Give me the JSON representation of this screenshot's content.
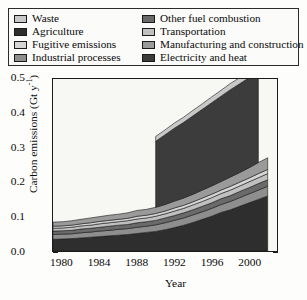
{
  "legend": {
    "items": [
      {
        "label": "Waste",
        "color": "#c8c8c8",
        "col": "left"
      },
      {
        "label": "Agriculture",
        "color": "#2e2e2e",
        "col": "left"
      },
      {
        "label": "Fugitive emissions",
        "color": "#d5d5d5",
        "col": "left"
      },
      {
        "label": "Industrial processes",
        "color": "#8e8e8e",
        "col": "left"
      },
      {
        "label": "Other fuel combustion",
        "color": "#6a6a6a",
        "col": "right"
      },
      {
        "label": "Transportation",
        "color": "#c0c0c0",
        "col": "right"
      },
      {
        "label": "Manufacturing and construction",
        "color": "#9a9a9a",
        "col": "right"
      },
      {
        "label": "Electricity and heat",
        "color": "#3c3c3c",
        "col": "right"
      }
    ]
  },
  "axes": {
    "ylabel_main": "Carbon emissions (Gt y",
    "ylabel_sup": "-1",
    "ylabel_close": ")",
    "xlabel": "Year",
    "yticks": [
      "0.0",
      "0.1",
      "0.2",
      "0.3",
      "0.4",
      "0.5"
    ],
    "xticks": [
      "1980",
      "1984",
      "1988",
      "1992",
      "1996",
      "2000"
    ]
  },
  "chart_data": {
    "type": "area",
    "title": "",
    "xlabel": "Year",
    "ylabel": "Carbon emissions (Gt y-1)",
    "xlim": [
      1979,
      2003
    ],
    "ylim": [
      0.0,
      0.5
    ],
    "grid": false,
    "legend_position": "above-plot",
    "stacking": "stacked",
    "stack_order_bottom_to_top": [
      "Agriculture",
      "Industrial processes",
      "Other fuel combustion",
      "Transportation",
      "Fugitive emissions",
      "Manufacturing and construction",
      "Electricity and heat",
      "Waste"
    ],
    "x": [
      1979,
      1980,
      1981,
      1982,
      1983,
      1984,
      1985,
      1986,
      1987,
      1988,
      1989,
      1990,
      1991,
      1992,
      1993,
      1994,
      1995,
      1996,
      1997,
      1998,
      1999,
      2000,
      2001,
      2002
    ],
    "series": [
      {
        "name": "Agriculture",
        "color": "#2e2e2e",
        "values": [
          0.034,
          0.035,
          0.036,
          0.038,
          0.04,
          0.042,
          0.044,
          0.046,
          0.048,
          0.051,
          0.054,
          0.057,
          0.062,
          0.068,
          0.075,
          0.083,
          0.092,
          0.101,
          0.112,
          0.12,
          0.13,
          0.14,
          0.15,
          0.16
        ]
      },
      {
        "name": "Industrial processes",
        "color": "#8e8e8e",
        "values": [
          0.014,
          0.014,
          0.014,
          0.015,
          0.015,
          0.016,
          0.016,
          0.017,
          0.017,
          0.018,
          0.018,
          0.019,
          0.02,
          0.021,
          0.021,
          0.022,
          0.022,
          0.023,
          0.023,
          0.024,
          0.025,
          0.026,
          0.027,
          0.028
        ]
      },
      {
        "name": "Other fuel combustion",
        "color": "#6a6a6a",
        "values": [
          0.01,
          0.01,
          0.01,
          0.011,
          0.011,
          0.011,
          0.012,
          0.012,
          0.012,
          0.013,
          0.013,
          0.013,
          0.014,
          0.014,
          0.015,
          0.015,
          0.016,
          0.016,
          0.017,
          0.017,
          0.018,
          0.018,
          0.019,
          0.019
        ]
      },
      {
        "name": "Transportation",
        "color": "#c0c0c0",
        "values": [
          0.008,
          0.008,
          0.009,
          0.009,
          0.009,
          0.01,
          0.01,
          0.01,
          0.011,
          0.011,
          0.011,
          0.012,
          0.012,
          0.013,
          0.013,
          0.014,
          0.014,
          0.015,
          0.015,
          0.016,
          0.016,
          0.017,
          0.017,
          0.018
        ]
      },
      {
        "name": "Fugitive emissions",
        "color": "#d5d5d5",
        "values": [
          0.006,
          0.006,
          0.006,
          0.006,
          0.007,
          0.007,
          0.007,
          0.007,
          0.007,
          0.008,
          0.008,
          0.008,
          0.008,
          0.009,
          0.009,
          0.009,
          0.01,
          0.01,
          0.01,
          0.011,
          0.011,
          0.011,
          0.012,
          0.012
        ]
      },
      {
        "name": "Manufacturing and construction",
        "color": "#9a9a9a",
        "values": [
          0.012,
          0.012,
          0.013,
          0.013,
          0.014,
          0.014,
          0.015,
          0.015,
          0.016,
          0.017,
          0.017,
          0.018,
          0.019,
          0.02,
          0.021,
          0.022,
          0.023,
          0.024,
          0.025,
          0.027,
          0.028,
          0.03,
          0.032,
          0.034
        ]
      },
      {
        "name": "Electricity and heat",
        "color": "#3c3c3c",
        "note": "present only 1990-2001",
        "values": [
          null,
          null,
          null,
          null,
          null,
          null,
          null,
          null,
          null,
          null,
          null,
          0.192,
          0.203,
          0.212,
          0.22,
          0.228,
          0.235,
          0.242,
          0.248,
          0.254,
          0.258,
          0.262,
          0.265,
          null
        ]
      },
      {
        "name": "Waste",
        "color": "#c8c8c8",
        "note": "present only 1990-2001",
        "values": [
          null,
          null,
          null,
          null,
          null,
          null,
          null,
          null,
          null,
          null,
          null,
          0.014,
          0.014,
          0.015,
          0.015,
          0.016,
          0.016,
          0.017,
          0.017,
          0.018,
          0.018,
          0.019,
          0.019,
          null
        ]
      }
    ]
  }
}
